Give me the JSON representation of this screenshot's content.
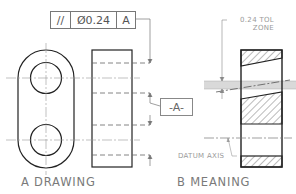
{
  "figure": {
    "drawing": {
      "caption": "A DRAWING",
      "feature_control_frame": {
        "symbol": "//",
        "symbol_name": "parallelism",
        "tolerance": "Ø0.24",
        "datum_ref": "A"
      },
      "datum_label": "-A-"
    },
    "meaning": {
      "caption": "B MEANING",
      "tol_zone_label_line1": "0.24 TOL",
      "tol_zone_label_line2": "ZONE",
      "datum_axis_label": "DATUM AXIS"
    }
  },
  "colors": {
    "line": "#222222",
    "thin": "#8a8a8a",
    "zone": "#d9d9d9",
    "hatch": "#555555"
  }
}
